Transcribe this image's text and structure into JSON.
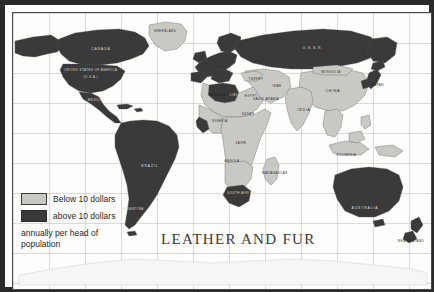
{
  "figure": {
    "title": "LEATHER AND FUR",
    "type": "choropleth world map"
  },
  "legend": {
    "items": [
      {
        "swatch": "light",
        "label": "Below 10 dollars",
        "color": "#c9c9c4"
      },
      {
        "swatch": "dark",
        "label": "above 10 dollars",
        "color": "#3a3a3a"
      }
    ],
    "note_line1": "annually per head of",
    "note_line2": "population"
  },
  "colors": {
    "below_10_dollars": "#c9c9c4",
    "above_10_dollars": "#3a3a3a",
    "ocean": "#fdfdfc",
    "frame": "#2b2b2b",
    "graticule": "#7b8caa",
    "border_line": "#555555"
  },
  "map_labels": [
    {
      "name": "CANADA",
      "x": 88,
      "y": 36,
      "tone": "on-dark",
      "size": "normal"
    },
    {
      "name": "UNITED STATES OF AMERICA",
      "x": 78,
      "y": 57,
      "tone": "on-dark",
      "size": "tiny"
    },
    {
      "name": "(U.S.A.)",
      "x": 78,
      "y": 64,
      "tone": "on-dark",
      "size": "tiny"
    },
    {
      "name": "GREENLAND",
      "x": 152,
      "y": 18,
      "tone": "on-light",
      "size": "tiny"
    },
    {
      "name": "MEXICO",
      "x": 82,
      "y": 87,
      "tone": "on-dark",
      "size": "tiny"
    },
    {
      "name": "BRAZIL",
      "x": 137,
      "y": 153,
      "tone": "on-dark",
      "size": "normal"
    },
    {
      "name": "ARGENTINA",
      "x": 120,
      "y": 196,
      "tone": "on-dark",
      "size": "tiny"
    },
    {
      "name": "ALGERIA",
      "x": 205,
      "y": 82,
      "tone": "on-light",
      "size": "tiny"
    },
    {
      "name": "LIBYA",
      "x": 222,
      "y": 82,
      "tone": "on-dark",
      "size": "tiny"
    },
    {
      "name": "EGYPT",
      "x": 238,
      "y": 83,
      "tone": "on-light",
      "size": "tiny"
    },
    {
      "name": "SUDAN",
      "x": 235,
      "y": 101,
      "tone": "on-light",
      "size": "tiny"
    },
    {
      "name": "NIGERIA",
      "x": 207,
      "y": 108,
      "tone": "on-light",
      "size": "tiny"
    },
    {
      "name": "ZAIRE",
      "x": 228,
      "y": 130,
      "tone": "on-light",
      "size": "tiny"
    },
    {
      "name": "ANGOLA",
      "x": 219,
      "y": 148,
      "tone": "on-light",
      "size": "tiny"
    },
    {
      "name": "MADAGASCAR",
      "x": 262,
      "y": 160,
      "tone": "on-light",
      "size": "tiny"
    },
    {
      "name": "SOUTH AFRICA",
      "x": 228,
      "y": 180,
      "tone": "on-dark",
      "size": "tiny"
    },
    {
      "name": "U.S.S.R.",
      "x": 300,
      "y": 35,
      "tone": "on-dark",
      "size": "normal"
    },
    {
      "name": "TURKEY",
      "x": 243,
      "y": 66,
      "tone": "on-light",
      "size": "tiny"
    },
    {
      "name": "IRAN",
      "x": 264,
      "y": 73,
      "tone": "on-light",
      "size": "tiny"
    },
    {
      "name": "SAUDI ARABIA",
      "x": 253,
      "y": 86,
      "tone": "on-light",
      "size": "tiny"
    },
    {
      "name": "CHINA",
      "x": 320,
      "y": 78,
      "tone": "on-light",
      "size": "normal"
    },
    {
      "name": "MONGOLIA",
      "x": 318,
      "y": 59,
      "tone": "on-light",
      "size": "tiny"
    },
    {
      "name": "INDIA",
      "x": 291,
      "y": 97,
      "tone": "on-light",
      "size": "normal"
    },
    {
      "name": "JAPAN",
      "x": 365,
      "y": 72,
      "tone": "on-light",
      "size": "tiny"
    },
    {
      "name": "INDONESIA",
      "x": 333,
      "y": 142,
      "tone": "on-light",
      "size": "tiny"
    },
    {
      "name": "AUSTRALIA",
      "x": 352,
      "y": 195,
      "tone": "on-dark",
      "size": "normal"
    },
    {
      "name": "NEW ZEALAND",
      "x": 398,
      "y": 228,
      "tone": "on-light",
      "size": "tiny"
    }
  ]
}
